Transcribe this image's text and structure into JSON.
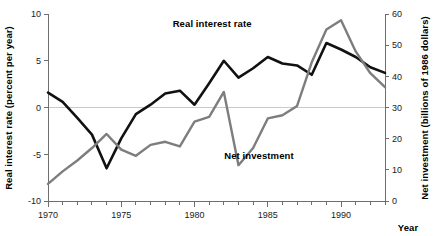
{
  "chart_data": {
    "type": "line",
    "title": "",
    "xlabel": "Year",
    "x": [
      1970,
      1971,
      1972,
      1973,
      1974,
      1975,
      1976,
      1977,
      1978,
      1979,
      1980,
      1981,
      1982,
      1983,
      1984,
      1985,
      1986,
      1987,
      1988,
      1989,
      1990,
      1991,
      1992,
      1993
    ],
    "xlim": [
      1970,
      1993
    ],
    "xticks": [
      1970,
      1971,
      1972,
      1973,
      1974,
      1975,
      1976,
      1977,
      1978,
      1979,
      1980,
      1981,
      1982,
      1983,
      1984,
      1985,
      1986,
      1987,
      1988,
      1989,
      1990,
      1991,
      1992,
      1993
    ],
    "xticklabels_shown": [
      "1970",
      "1975",
      "1980",
      "1985",
      "1990"
    ],
    "xticklabel_values": [
      1970,
      1975,
      1980,
      1985,
      1990
    ],
    "grid": false,
    "zero_line": true,
    "legend_position": "inline-annotation",
    "axes": [
      {
        "id": "left",
        "label": "Real interest rate (percent per year)",
        "ylim": [
          -10,
          10
        ],
        "yticks": [
          -10,
          -5,
          0,
          5,
          10
        ],
        "yticklabels": [
          "-10",
          "-5",
          "0",
          "5",
          "10"
        ]
      },
      {
        "id": "right",
        "label": "Net investment (billions of 1986 dollars)",
        "ylim": [
          0,
          60
        ],
        "yticks": [
          0,
          10,
          20,
          30,
          40,
          50,
          60
        ],
        "yticklabels": [
          "0",
          "10",
          "20",
          "30",
          "40",
          "50",
          "60"
        ]
      }
    ],
    "series": [
      {
        "name": "Real interest rate",
        "axis": "left",
        "color": "#111111",
        "label_position": {
          "x": 1981.2,
          "y": 8.6
        },
        "values": [
          1.6,
          0.6,
          -1.1,
          -2.9,
          -6.5,
          -3.3,
          -0.7,
          0.3,
          1.5,
          1.8,
          0.3,
          2.6,
          5.0,
          3.2,
          4.2,
          5.4,
          4.7,
          4.5,
          3.5,
          6.9,
          6.2,
          5.4,
          4.3,
          3.7
        ]
      },
      {
        "name": "Net investment",
        "axis": "right",
        "color": "#7d7d7d",
        "label_position": {
          "x": 1984.4,
          "y": 13.5
        },
        "values": [
          5.5,
          9.5,
          13.0,
          17.0,
          21.5,
          16.5,
          14.5,
          18.0,
          19.0,
          17.5,
          25.5,
          27.0,
          35.0,
          11.5,
          17.0,
          26.5,
          27.5,
          30.5,
          44.5,
          55.0,
          58.0,
          48.0,
          41.0,
          36.5
        ]
      }
    ],
    "colors": {
      "real_interest_rate": "#111111",
      "net_investment": "#7d7d7d",
      "axis": "#6e6e6e",
      "zero_line": "#c9c9c9",
      "text": "#000000",
      "background": "#ffffff"
    }
  }
}
